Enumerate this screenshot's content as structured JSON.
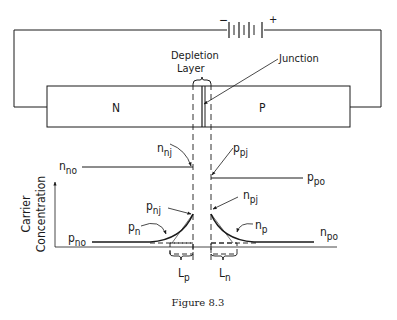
{
  "figure": {
    "caption": "Figure 8.3",
    "battery": {
      "minus_label": "−",
      "plus_label": "+"
    },
    "regions": {
      "n_label": "N",
      "p_label": "P"
    },
    "callouts": {
      "depletion_line1": "Depletion",
      "depletion_line2": "Layer",
      "junction": "Junction"
    },
    "axis": {
      "ylabel_line1": "Carrier",
      "ylabel_line2": "Concentration"
    },
    "curve_labels": {
      "n_no": {
        "base": "n",
        "sub": "no"
      },
      "n_nj": {
        "base": "n",
        "sub": "nj"
      },
      "p_pj": {
        "base": "p",
        "sub": "pj"
      },
      "p_po": {
        "base": "p",
        "sub": "po"
      },
      "p_nj": {
        "base": "p",
        "sub": "nj"
      },
      "n_pj": {
        "base": "n",
        "sub": "pj"
      },
      "p_n": {
        "base": "p",
        "sub": "n"
      },
      "n_p": {
        "base": "n",
        "sub": "p"
      },
      "p_no": {
        "base": "p",
        "sub": "no"
      },
      "n_po": {
        "base": "n",
        "sub": "po"
      },
      "L_p": {
        "base": "L",
        "sub": "p"
      },
      "L_n": {
        "base": "L",
        "sub": "n"
      }
    }
  }
}
